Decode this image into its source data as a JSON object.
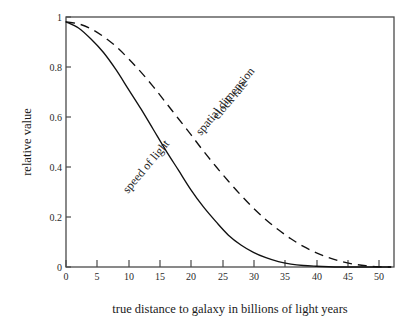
{
  "chart_data": {
    "type": "line",
    "title": "",
    "xlabel": "true distance to galaxy in billions of light years",
    "ylabel": "relative value",
    "xlim": [
      0,
      52.5
    ],
    "ylim": [
      0,
      1.02
    ],
    "grid": false,
    "legend_position": "inline-curve-labels",
    "x_ticks": [
      0,
      5,
      10,
      15,
      20,
      25,
      30,
      35,
      40,
      45,
      50
    ],
    "x_tick_labels": [
      "0",
      "5",
      "10",
      "15",
      "20",
      "25",
      "30",
      "35",
      "40",
      "45",
      "50"
    ],
    "y_ticks": [
      0,
      0.2,
      0.4,
      0.6,
      0.8,
      1
    ],
    "y_tick_labels": [
      "0",
      "0.2",
      "0.4",
      "0.6",
      "0.8",
      "1"
    ],
    "x": [
      0,
      2,
      4,
      6,
      8,
      10,
      12,
      14,
      16,
      18,
      20,
      22,
      24,
      26,
      28,
      30,
      32,
      34,
      36,
      38,
      40,
      42,
      44,
      46,
      48,
      50,
      52
    ],
    "series": [
      {
        "name": "speed of light",
        "style": "solid",
        "label_text": "speed of light",
        "label_rotation": -50,
        "values": [
          1.0,
          0.975,
          0.93,
          0.875,
          0.805,
          0.725,
          0.645,
          0.56,
          0.475,
          0.395,
          0.315,
          0.245,
          0.185,
          0.13,
          0.09,
          0.06,
          0.038,
          0.022,
          0.012,
          0.006,
          0.003,
          0.001,
          0.0,
          0.0,
          0.0,
          0.0,
          0.0
        ]
      },
      {
        "name": "clock rate / spatial dimension",
        "style": "dashed",
        "label_text_1": "clock rate",
        "label_text_2": "spatial dimension",
        "label_rotation": -50,
        "values": [
          1.0,
          0.992,
          0.972,
          0.94,
          0.9,
          0.85,
          0.795,
          0.735,
          0.67,
          0.605,
          0.54,
          0.473,
          0.41,
          0.35,
          0.293,
          0.24,
          0.193,
          0.152,
          0.115,
          0.084,
          0.059,
          0.039,
          0.023,
          0.012,
          0.005,
          0.001,
          0.0
        ]
      }
    ]
  },
  "axes": {
    "y_title": "relative value",
    "x_title": "true distance to galaxy in billions of light years"
  },
  "labels": {
    "clock_rate": "clock rate",
    "spatial_dimension": "spatial dimension",
    "speed_of_light": "speed of light"
  },
  "y_ticks": [
    {
      "label": "1"
    },
    {
      "label": "0.8"
    },
    {
      "label": "0.6"
    },
    {
      "label": "0.4"
    },
    {
      "label": "0.2"
    },
    {
      "label": "0"
    }
  ],
  "x_ticks": [
    {
      "label": "0"
    },
    {
      "label": "5"
    },
    {
      "label": "10"
    },
    {
      "label": "15"
    },
    {
      "label": "20"
    },
    {
      "label": "25"
    },
    {
      "label": "30"
    },
    {
      "label": "35"
    },
    {
      "label": "40"
    },
    {
      "label": "45"
    },
    {
      "label": "50"
    }
  ],
  "colors": {
    "ink": "#111111",
    "frame": "#4a4a4a",
    "background": "#ffffff"
  }
}
